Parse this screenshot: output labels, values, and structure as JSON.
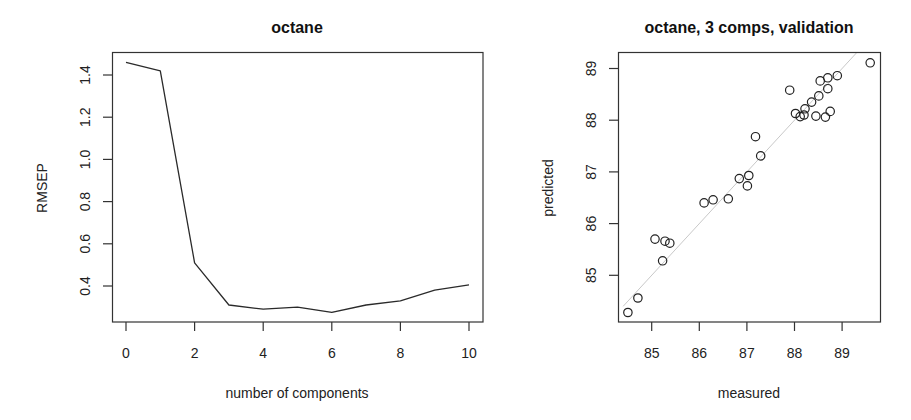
{
  "chart_data": [
    {
      "type": "line",
      "title": "octane",
      "xlabel": "number of components",
      "ylabel": "RMSEP",
      "x": [
        0,
        1,
        2,
        3,
        4,
        5,
        6,
        7,
        8,
        9,
        10
      ],
      "values": [
        1.46,
        1.42,
        0.51,
        0.31,
        0.29,
        0.3,
        0.275,
        0.31,
        0.33,
        0.38,
        0.405
      ],
      "xticks": [
        0,
        2,
        4,
        6,
        8,
        10
      ],
      "yticks": [
        0.4,
        0.6,
        0.8,
        1.0,
        1.2,
        1.4
      ],
      "ytick_labels": [
        "0.4",
        "0.6",
        "0.8",
        "1.0",
        "1.2",
        "1.4"
      ],
      "xlim": [
        -0.4,
        10.4
      ],
      "ylim": [
        0.23,
        1.51
      ],
      "grid": false,
      "legend": null
    },
    {
      "type": "scatter",
      "title": "octane, 3 comps, validation",
      "xlabel": "measured",
      "ylabel": "predicted",
      "points": [
        [
          84.5,
          84.28
        ],
        [
          84.71,
          84.56
        ],
        [
          85.07,
          85.7
        ],
        [
          85.28,
          85.66
        ],
        [
          85.38,
          85.62
        ],
        [
          85.23,
          85.28
        ],
        [
          86.1,
          86.4
        ],
        [
          86.29,
          86.46
        ],
        [
          86.61,
          86.48
        ],
        [
          86.84,
          86.87
        ],
        [
          87.04,
          86.93
        ],
        [
          87.01,
          86.73
        ],
        [
          87.18,
          87.68
        ],
        [
          87.29,
          87.31
        ],
        [
          87.9,
          88.58
        ],
        [
          88.54,
          88.76
        ],
        [
          88.7,
          88.82
        ],
        [
          88.9,
          88.86
        ],
        [
          88.7,
          88.61
        ],
        [
          88.51,
          88.47
        ],
        [
          88.36,
          88.35
        ],
        [
          88.22,
          88.22
        ],
        [
          88.02,
          88.13
        ],
        [
          88.12,
          88.07
        ],
        [
          88.2,
          88.1
        ],
        [
          88.45,
          88.08
        ],
        [
          88.65,
          88.06
        ],
        [
          88.75,
          88.17
        ],
        [
          89.59,
          89.11
        ]
      ],
      "reference_line": {
        "type": "y=x",
        "color": "#c8c8c8"
      },
      "xticks": [
        85,
        86,
        87,
        88,
        89
      ],
      "yticks": [
        85,
        86,
        87,
        88,
        89
      ],
      "xlim": [
        84.3,
        89.82
      ],
      "ylim": [
        84.08,
        89.31
      ],
      "grid": false,
      "legend": null
    }
  ]
}
